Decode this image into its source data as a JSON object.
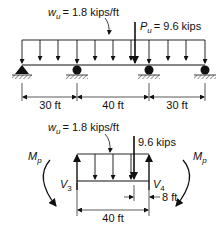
{
  "top_beam": {
    "distributed_load_label": "w",
    "distributed_load_sub": "u",
    "distributed_load_value": "= 1.8 kips/ft",
    "point_load_label": "P",
    "point_load_sub": "u",
    "point_load_value": "= 9.6 kips",
    "spans": [
      "30 ft",
      "40 ft",
      "30 ft"
    ],
    "supports": [
      "pin",
      "roller",
      "roller",
      "roller"
    ]
  },
  "free_body": {
    "distributed_load_label": "w",
    "distributed_load_sub": "u",
    "distributed_load_value": "= 1.8 kips/ft",
    "point_load_value": "9.6 kips",
    "moment_left_label": "M",
    "moment_left_sub": "p",
    "moment_right_label": "M",
    "moment_right_sub": "p",
    "shear_left_label": "V",
    "shear_left_sub": "3",
    "shear_right_label": "V",
    "shear_right_sub": "4",
    "span_length": "40 ft",
    "point_load_offset": "8 ft"
  }
}
